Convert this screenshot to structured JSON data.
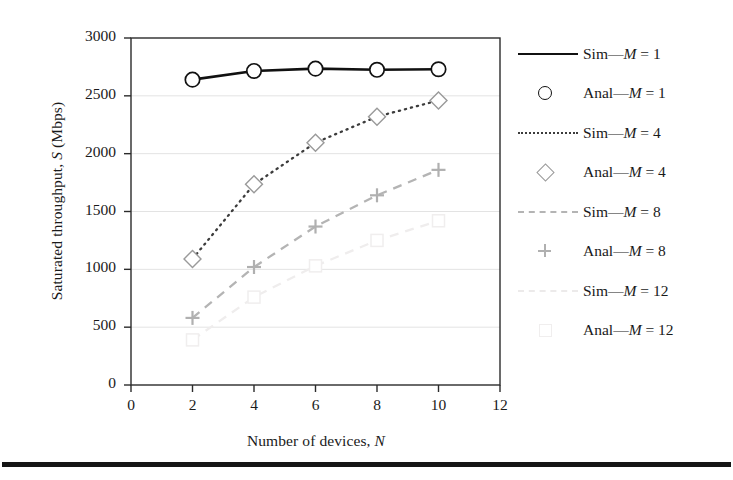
{
  "chart_data": {
    "type": "line",
    "title": "",
    "xlabel": "Number of devices, N",
    "ylabel": "Saturated throughput, S (Mbps)",
    "xlim": [
      0,
      12
    ],
    "ylim": [
      0,
      3000
    ],
    "xticks": [
      0,
      2,
      4,
      6,
      8,
      10,
      12
    ],
    "yticks": [
      0,
      500,
      1000,
      1500,
      2000,
      2500,
      3000
    ],
    "grid": "horizontal",
    "legend_position": "right",
    "x": [
      2,
      4,
      6,
      8,
      10
    ],
    "series": [
      {
        "name": "Sim—M = 1",
        "kind": "line",
        "style": "solid",
        "color": "#111111",
        "values": [
          2640,
          2715,
          2735,
          2725,
          2730
        ]
      },
      {
        "name": "Anal—M = 1",
        "kind": "marker",
        "marker": "circle",
        "color": "#111111",
        "values": [
          2640,
          2715,
          2735,
          2725,
          2730
        ]
      },
      {
        "name": "Sim—M = 4",
        "kind": "line",
        "style": "dotted",
        "color": "#3c3c3c",
        "values": [
          1090,
          1735,
          2095,
          2320,
          2460
        ]
      },
      {
        "name": "Anal—M = 4",
        "kind": "marker",
        "marker": "diamond",
        "color": "#9a9a9a",
        "values": [
          1090,
          1735,
          2095,
          2320,
          2460
        ]
      },
      {
        "name": "Sim—M = 8",
        "kind": "line",
        "style": "dashed",
        "color": "#b4b4b4",
        "values": [
          580,
          1020,
          1370,
          1640,
          1860
        ]
      },
      {
        "name": "Anal—M = 8",
        "kind": "marker",
        "marker": "plus",
        "color": "#b0b0b0",
        "values": [
          580,
          1020,
          1370,
          1640,
          1860
        ]
      },
      {
        "name": "Sim—M = 12",
        "kind": "line",
        "style": "dashed",
        "color": "#efeded",
        "values": [
          390,
          760,
          1030,
          1250,
          1420
        ]
      },
      {
        "name": "Anal—M = 12",
        "kind": "marker",
        "marker": "square",
        "color": "#f0eeee",
        "values": [
          390,
          760,
          1030,
          1250,
          1420
        ]
      }
    ]
  },
  "axes": {
    "ylabel_pre": "Saturated throughput, ",
    "ylabel_ital": "S",
    "ylabel_post": " (Mbps)",
    "xlabel_pre": "Number of devices, ",
    "xlabel_ital": "N",
    "xlabel_post": ""
  },
  "legend": {
    "items": [
      {
        "pre": "Sim—",
        "ital": "M",
        "post": " = 1"
      },
      {
        "pre": "Anal—",
        "ital": "M",
        "post": " = 1"
      },
      {
        "pre": "Sim—",
        "ital": "M",
        "post": " = 4"
      },
      {
        "pre": "Anal—",
        "ital": "M",
        "post": " = 4"
      },
      {
        "pre": "Sim—",
        "ital": "M",
        "post": " = 8"
      },
      {
        "pre": "Anal—",
        "ital": "M",
        "post": " = 8"
      },
      {
        "pre": "Sim—",
        "ital": "M",
        "post": " = 12"
      },
      {
        "pre": "Anal—",
        "ital": "M",
        "post": " = 12"
      }
    ]
  }
}
